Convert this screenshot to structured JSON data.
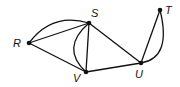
{
  "diagram": {
    "type": "graph",
    "nodes": [
      {
        "id": "R",
        "label": "R",
        "x": 29,
        "y": 43,
        "lx": 13,
        "ly": 47
      },
      {
        "id": "S",
        "label": "S",
        "x": 89,
        "y": 23,
        "lx": 91,
        "ly": 17
      },
      {
        "id": "V",
        "label": "V",
        "x": 86,
        "y": 72,
        "lx": 73,
        "ly": 82
      },
      {
        "id": "U",
        "label": "U",
        "x": 141,
        "y": 63,
        "lx": 135,
        "ly": 78
      },
      {
        "id": "T",
        "label": "T",
        "x": 160,
        "y": 10,
        "lx": 165,
        "ly": 14
      }
    ],
    "edges": [
      {
        "from": "R",
        "to": "S",
        "kind": "straight"
      },
      {
        "from": "R",
        "to": "S",
        "kind": "curved",
        "path": "M29,43 Q52,12 89,23"
      },
      {
        "from": "R",
        "to": "V",
        "kind": "straight"
      },
      {
        "from": "S",
        "to": "V",
        "kind": "straight"
      },
      {
        "from": "S",
        "to": "V",
        "kind": "curved",
        "path": "M89,23 Q60,48 86,72"
      },
      {
        "from": "S",
        "to": "U",
        "kind": "straight"
      },
      {
        "from": "V",
        "to": "U",
        "kind": "straight"
      },
      {
        "from": "U",
        "to": "T",
        "kind": "straight"
      },
      {
        "from": "U",
        "to": "T",
        "kind": "curved",
        "path": "M141,63 Q172,58 160,10"
      }
    ]
  }
}
